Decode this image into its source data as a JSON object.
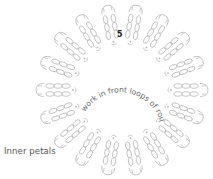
{
  "diagram": {
    "type": "crochet-chart",
    "round_label": "5",
    "instruction": "work in front loops of round 3",
    "caption": "Inner petals",
    "petal_count": 18,
    "center": [
      122,
      90
    ],
    "colors": {
      "stitch_line": "#b8b8b8",
      "text": "#666666",
      "round_number": "#222222",
      "caption": "#555555"
    }
  }
}
